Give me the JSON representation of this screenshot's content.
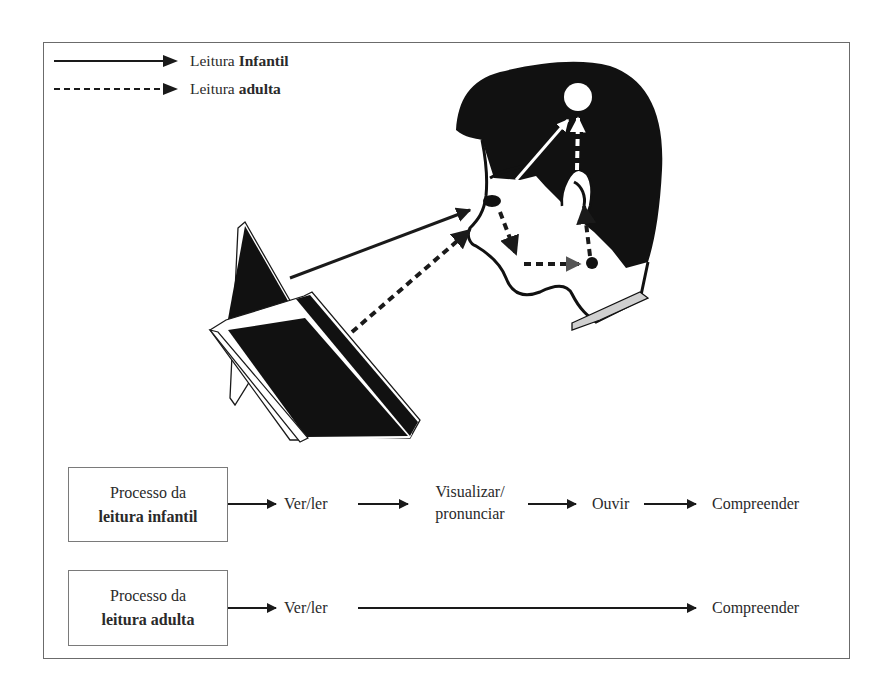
{
  "legend": {
    "items": [
      {
        "line_style": "solid",
        "label_prefix": "Leitura",
        "label_bold": "Infantil"
      },
      {
        "line_style": "dashed",
        "label_prefix": "Leitura",
        "label_bold": "adulta"
      }
    ]
  },
  "illustration": {
    "elements": [
      "open-book",
      "head-profile",
      "eye",
      "mouth",
      "ear",
      "brain-circle"
    ],
    "paths": [
      {
        "name": "child-book-to-eye",
        "style": "solid",
        "color": "#1a1a1a"
      },
      {
        "name": "adult-book-to-eye",
        "style": "dashed",
        "color": "#1a1a1a"
      },
      {
        "name": "child-eye-to-brain",
        "style": "solid",
        "color": "#ffffff"
      },
      {
        "name": "child-eye-to-mouth",
        "style": "dashed",
        "color": "#1a1a1a"
      },
      {
        "name": "child-mouth-to-ear",
        "style": "dashed",
        "color": "#1a1a1a"
      },
      {
        "name": "child-ear-to-brain",
        "style": "dashed",
        "color": "#ffffff"
      }
    ]
  },
  "processes": [
    {
      "box_line1": "Processo da",
      "box_line2": "leitura infantil",
      "steps": [
        "Ver/ler",
        "Visualizar/",
        "pronunciar",
        "Ouvir",
        "Compreender"
      ]
    },
    {
      "box_line1": "Processo da",
      "box_line2": "leitura adulta",
      "steps": [
        "Ver/ler",
        "Compreender"
      ]
    }
  ],
  "colors": {
    "ink": "#1a1a1a",
    "frame": "#6b6b6b",
    "collar": "#d0d0d0",
    "background": "#ffffff"
  }
}
